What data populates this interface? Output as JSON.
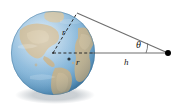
{
  "figure": {
    "width": 191,
    "height": 109,
    "background_color": "#ffffff"
  },
  "labels": {
    "radius_slant": "r",
    "radius_horizontal": "r",
    "angle": "θ",
    "height": "h"
  },
  "colors": {
    "ocean_light": "#bfd9ec",
    "ocean_mid": "#8fbcdc",
    "ocean_deep": "#5e9ac8",
    "land_tan": "#c8b793",
    "land_olive": "#b0a173",
    "line_gray": "#6e6e6e",
    "dash_dark": "#2b2b2b",
    "dot_black": "#000000",
    "shadow": "#9aa3ab"
  },
  "geometry": {
    "globe_center_x": 53,
    "globe_center_y": 53,
    "globe_radius": 42,
    "tangent_point_x": 77,
    "tangent_point_y": 13,
    "external_point_x": 168,
    "external_point_y": 53,
    "surface_point_x": 95,
    "surface_point_y": 53
  },
  "elements": {
    "globe_name": "earth-globe",
    "tangent_line_name": "tangent-line",
    "baseline_name": "height-baseline",
    "external_dot_name": "external-observer-point",
    "angle_arc_name": "theta-angle-arc"
  }
}
